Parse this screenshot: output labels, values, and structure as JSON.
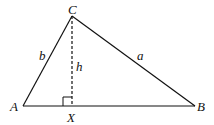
{
  "diagram": {
    "type": "triangle-altitude",
    "vertices": {
      "A": {
        "label": "A",
        "x": 23,
        "y": 106
      },
      "B": {
        "label": "B",
        "x": 195,
        "y": 106
      },
      "C": {
        "label": "C",
        "x": 72,
        "y": 16
      }
    },
    "foot": {
      "label": "X",
      "x": 72,
      "y": 106
    },
    "sides": {
      "a": {
        "label": "a",
        "from": "C",
        "to": "B"
      },
      "b": {
        "label": "b",
        "from": "A",
        "to": "C"
      }
    },
    "altitude": {
      "label": "h",
      "from": "C",
      "to": "X",
      "style": "dashed"
    },
    "right_angle_marker": {
      "at": "X"
    },
    "colors": {
      "stroke": "#111111",
      "background": "#ffffff"
    }
  }
}
